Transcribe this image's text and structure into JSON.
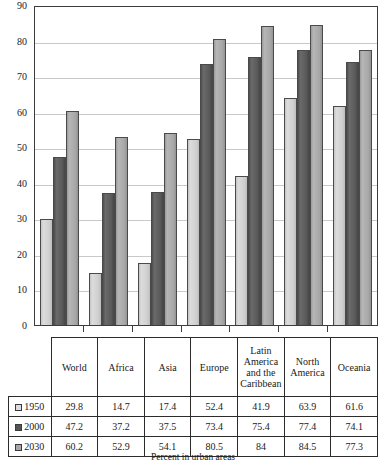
{
  "chart_data": {
    "type": "bar",
    "title": "",
    "xlabel": "",
    "ylabel": "",
    "caption": "Percent in urban areas",
    "ylim": [
      0,
      90
    ],
    "yticks": [
      0,
      10,
      20,
      30,
      40,
      50,
      60,
      70,
      80,
      90
    ],
    "grid": true,
    "legend_position": "table-left",
    "categories": [
      "World",
      "Africa",
      "Asia",
      "Europe",
      "Latin America and the Caribbean",
      "North America",
      "Oceania"
    ],
    "series": [
      {
        "name": "1950",
        "color": "#dcdcdc",
        "values": [
          29.8,
          14.7,
          17.4,
          52.4,
          41.9,
          63.9,
          61.6
        ],
        "labels": [
          "29.8",
          "14.7",
          "17.4",
          "52.4",
          "41.9",
          "63.9",
          "61.6"
        ]
      },
      {
        "name": "2000",
        "color": "#555555",
        "values": [
          47.2,
          37.2,
          37.5,
          73.4,
          75.4,
          77.4,
          74.1
        ],
        "labels": [
          "47.2",
          "37.2",
          "37.5",
          "73.4",
          "75.4",
          "77.4",
          "74.1"
        ]
      },
      {
        "name": "2030",
        "color": "#a8a8a8",
        "values": [
          60.2,
          52.9,
          54.1,
          80.5,
          84,
          84.5,
          77.3
        ],
        "labels": [
          "60.2",
          "52.9",
          "54.1",
          "80.5",
          "84",
          "84.5",
          "77.3"
        ]
      }
    ]
  }
}
